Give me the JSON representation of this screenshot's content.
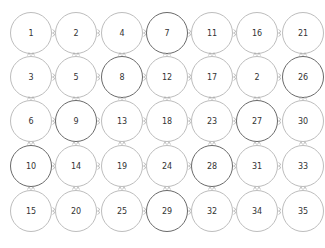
{
  "grid": {
    "rows": 5,
    "cols": 7,
    "cells": [
      [
        "1",
        "2",
        "4",
        "7",
        "11",
        "16",
        "21"
      ],
      [
        "3",
        "5",
        "8",
        "12",
        "17",
        "2",
        "26"
      ],
      [
        "6",
        "9",
        "13",
        "18",
        "23",
        "27",
        "30"
      ],
      [
        "10",
        "14",
        "19",
        "24",
        "28",
        "31",
        "33"
      ],
      [
        "15",
        "20",
        "25",
        "29",
        "32",
        "34",
        "35"
      ]
    ],
    "dark_border": [
      [
        false,
        false,
        false,
        true,
        false,
        false,
        false
      ],
      [
        false,
        false,
        true,
        false,
        false,
        false,
        true
      ],
      [
        false,
        true,
        false,
        false,
        false,
        true,
        false
      ],
      [
        true,
        false,
        false,
        false,
        true,
        false,
        false
      ],
      [
        false,
        false,
        false,
        true,
        false,
        false,
        false
      ]
    ],
    "col_centers": [
      31,
      76,
      122,
      167,
      212,
      257,
      303
    ],
    "row_centers": [
      33,
      77,
      121,
      166,
      211
    ],
    "colors": {
      "border_light": "#bdbdbd",
      "border_dark": "#6a6a6a",
      "connector": "#a8a8a8",
      "text": "#333333"
    }
  }
}
